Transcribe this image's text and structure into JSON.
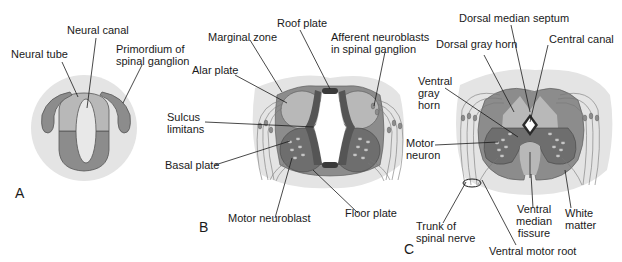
{
  "figure": {
    "colors": {
      "background": "#ffffff",
      "mesenchyme": "#e4e4e4",
      "light_gray": "#b8b8b8",
      "mid_gray": "#8c8c8c",
      "dark_gray": "#6e6e6e",
      "cavity": "#f2f2f2",
      "line": "#1a1a1a"
    },
    "panels": [
      {
        "id": "A",
        "letter": "A",
        "labels": {
          "neural_tube": "Neural tube",
          "neural_canal": "Neural canal",
          "primordium_line1": "Primordium of",
          "primordium_line2": "spinal ganglion"
        }
      },
      {
        "id": "B",
        "letter": "B",
        "labels": {
          "roof_plate": "Roof plate",
          "marginal_zone": "Marginal zone",
          "afferent_line1": "Afferent neuroblasts",
          "afferent_line2": "in spinal ganglion",
          "alar_plate": "Alar plate",
          "sulcus_line1": "Sulcus",
          "sulcus_line2": "limitans",
          "basal_plate": "Basal plate",
          "motor_neuroblast": "Motor neuroblast",
          "floor_plate": "Floor plate"
        }
      },
      {
        "id": "C",
        "letter": "C",
        "labels": {
          "dorsal_median_septum": "Dorsal median septum",
          "dorsal_gray_horn": "Dorsal gray horn",
          "central_canal": "Central canal",
          "ventral_gray_line1": "Ventral",
          "ventral_gray_line2": "gray",
          "ventral_gray_line3": "horn",
          "motor_neuron_line1": "Motor",
          "motor_neuron_line2": "neuron",
          "trunk_line1": "Trunk of",
          "trunk_line2": "spinal nerve",
          "ventral_median_line1": "Ventral",
          "ventral_median_line2": "median",
          "ventral_median_line3": "fissure",
          "white_matter_line1": "White",
          "white_matter_line2": "matter",
          "ventral_motor_root": "Ventral motor root"
        }
      }
    ]
  }
}
